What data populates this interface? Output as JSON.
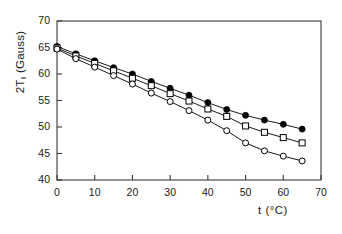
{
  "chart_data": {
    "type": "scatter",
    "title": "",
    "subtitle": "",
    "xlabel": "t (°C)",
    "ylabel": "2T∥ (Gauss)",
    "ylabel_main": "2T",
    "ylabel_sub": "‖",
    "ylabel_unit": " (Gauss)",
    "xlim": [
      0,
      70
    ],
    "ylim": [
      40,
      70
    ],
    "xticks": [
      0,
      10,
      20,
      30,
      40,
      50,
      60,
      70
    ],
    "yticks": [
      40,
      45,
      50,
      55,
      60,
      65,
      70
    ],
    "xtick_labels": [
      "0",
      "10",
      "20",
      "30",
      "40",
      "50",
      "60",
      "70"
    ],
    "ytick_labels": [
      "40",
      "45",
      "50",
      "55",
      "60",
      "65",
      "70"
    ],
    "grid": false,
    "legend": "none",
    "frame": "box",
    "series": [
      {
        "name": "series-filled-circle",
        "marker": "filled-circle",
        "color": "#000000",
        "x": [
          0,
          5,
          10,
          15,
          20,
          25,
          30,
          35,
          40,
          45,
          50,
          55,
          60,
          65
        ],
        "y": [
          65.2,
          63.8,
          62.5,
          61.2,
          60.0,
          58.6,
          57.3,
          56.0,
          54.6,
          53.3,
          52.2,
          51.3,
          50.5,
          49.6
        ]
      },
      {
        "name": "series-open-square",
        "marker": "open-square",
        "color": "#000000",
        "x": [
          0,
          5,
          10,
          15,
          20,
          25,
          30,
          35,
          40,
          45,
          50,
          55,
          60,
          65
        ],
        "y": [
          64.9,
          63.4,
          62.0,
          60.6,
          59.2,
          57.8,
          56.3,
          54.9,
          53.4,
          52.0,
          50.2,
          49.0,
          48.0,
          47.0
        ]
      },
      {
        "name": "series-open-circle",
        "marker": "open-circle",
        "color": "#000000",
        "x": [
          0,
          5,
          10,
          15,
          20,
          25,
          30,
          35,
          40,
          45,
          50,
          55,
          60,
          65
        ],
        "y": [
          64.7,
          62.9,
          61.3,
          59.7,
          58.1,
          56.4,
          54.8,
          53.1,
          51.3,
          49.3,
          47.0,
          45.5,
          44.5,
          43.6
        ]
      }
    ]
  },
  "axes_geometry": {
    "plot_left": 57,
    "plot_right": 321,
    "plot_top": 21,
    "plot_bottom": 180
  }
}
